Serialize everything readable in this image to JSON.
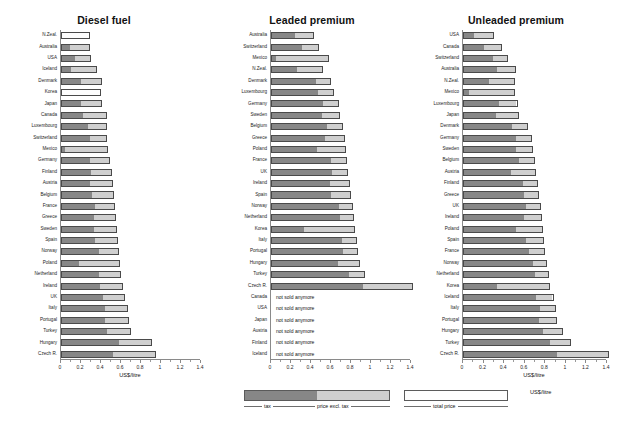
{
  "figure": {
    "unit_label": "US$/litre",
    "colors": {
      "tax": "#878787",
      "net": "#cfcfcf",
      "total": "#cfcfcf",
      "axis": "#8a8a8a"
    },
    "not_sold_text": "not sold anymore"
  },
  "legend_left": {
    "tax_label": "tax",
    "net_label": "price excl. tax"
  },
  "legend_right": {
    "total_label": "total price"
  },
  "chart_data": [
    {
      "type": "bar",
      "orientation": "horizontal",
      "stacked": true,
      "title": "Diesel fuel",
      "xlabel": "US$/litre",
      "ylabel": "",
      "xlim": [
        0,
        1.4
      ],
      "xticks": [
        0,
        0.2,
        0.4,
        0.6,
        0.8,
        1,
        1.2,
        1.4
      ],
      "xticklabels": [
        "0",
        "0.2",
        "0.4",
        "0.6",
        "0.8",
        "1",
        "1.2",
        "1.4"
      ],
      "grid": false,
      "legend_position": "bottom-center",
      "series": [
        {
          "name": "tax",
          "color": "#878787"
        },
        {
          "name": "price excl. tax",
          "color": "#cfcfcf"
        }
      ],
      "categories": [
        "N.Zeal.",
        "Australia",
        "USA",
        "Iceland",
        "Denmark",
        "Korea",
        "Japan",
        "Canada",
        "Luxembourg",
        "Switzerland",
        "Mexico",
        "Germany",
        "Finland",
        "Austria",
        "Belgium",
        "France",
        "Greece",
        "Sweden",
        "Spain",
        "Norway",
        "Poland",
        "Netherland",
        "Ireland",
        "UK",
        "Italy",
        "Portugal",
        "Turkey",
        "Hungary",
        "Czech R."
      ],
      "tax": [
        0.0,
        0.09,
        0.14,
        0.1,
        0.2,
        0.0,
        0.2,
        0.22,
        0.27,
        0.29,
        0.03,
        0.29,
        0.3,
        0.29,
        0.31,
        0.34,
        0.33,
        0.33,
        0.34,
        0.38,
        0.18,
        0.38,
        0.39,
        0.42,
        0.44,
        0.44,
        0.46,
        0.58,
        0.52
      ],
      "net": [
        0.29,
        0.2,
        0.16,
        0.26,
        0.21,
        0.4,
        0.21,
        0.24,
        0.19,
        0.17,
        0.44,
        0.2,
        0.21,
        0.23,
        0.22,
        0.2,
        0.22,
        0.23,
        0.23,
        0.2,
        0.41,
        0.22,
        0.23,
        0.22,
        0.23,
        0.24,
        0.24,
        0.33,
        0.43
      ],
      "totals": [
        0.29,
        0.29,
        0.3,
        0.36,
        0.41,
        0.4,
        0.41,
        0.46,
        0.46,
        0.46,
        0.47,
        0.49,
        0.51,
        0.52,
        0.53,
        0.54,
        0.55,
        0.56,
        0.57,
        0.58,
        0.59,
        0.6,
        0.62,
        0.64,
        0.67,
        0.68,
        0.7,
        0.91,
        0.95
      ]
    },
    {
      "type": "bar",
      "orientation": "horizontal",
      "stacked": true,
      "title": "Leaded premium",
      "xlabel": "",
      "ylabel": "",
      "xlim": [
        0,
        1.4
      ],
      "xticks": [
        0,
        0.2,
        0.4,
        0.6,
        0.8,
        1,
        1.2,
        1.4
      ],
      "xticklabels": [
        "0",
        "0.2",
        "0.4",
        "0.6",
        "0.8",
        "1",
        "1.2",
        "1.4"
      ],
      "grid": false,
      "legend_position": "bottom-center",
      "series": [
        {
          "name": "tax",
          "color": "#878787"
        },
        {
          "name": "price excl. tax",
          "color": "#cfcfcf"
        }
      ],
      "categories": [
        "Australia",
        "Switzerland",
        "Mexico",
        "N.Zeal.",
        "Denmark",
        "Luxembourg",
        "Germany",
        "Sweden",
        "Belgium",
        "Greece",
        "Poland",
        "France",
        "UK",
        "Ireland",
        "Spain",
        "Norway",
        "Netherland",
        "Korea",
        "Italy",
        "Portugal",
        "Hungary",
        "Turkey",
        "Czech R.",
        "Canada",
        "USA",
        "Japan",
        "Austria",
        "Finland",
        "Iceland"
      ],
      "tax": [
        0.24,
        0.31,
        0.04,
        0.26,
        0.45,
        0.48,
        0.53,
        0.52,
        0.57,
        0.54,
        0.46,
        0.61,
        0.62,
        0.6,
        0.6,
        0.69,
        0.7,
        0.33,
        0.72,
        0.73,
        0.68,
        0.79,
        0.92,
        null,
        null,
        null,
        null,
        null,
        null
      ],
      "net": [
        0.19,
        0.17,
        0.54,
        0.26,
        0.15,
        0.15,
        0.15,
        0.17,
        0.15,
        0.2,
        0.29,
        0.15,
        0.15,
        0.19,
        0.2,
        0.13,
        0.13,
        0.51,
        0.14,
        0.14,
        0.21,
        0.15,
        0.5,
        null,
        null,
        null,
        null,
        null,
        null
      ],
      "totals": [
        0.43,
        0.48,
        0.58,
        0.52,
        0.6,
        0.63,
        0.68,
        0.69,
        0.72,
        0.74,
        0.75,
        0.76,
        0.77,
        0.79,
        0.8,
        0.82,
        0.83,
        0.84,
        0.86,
        0.87,
        0.89,
        0.94,
        1.42,
        null,
        null,
        null,
        null,
        null,
        null
      ],
      "not_sold": [
        "Canada",
        "USA",
        "Japan",
        "Austria",
        "Finland",
        "Iceland"
      ]
    },
    {
      "type": "bar",
      "orientation": "horizontal",
      "stacked": true,
      "title": "Unleaded premium",
      "xlabel": "US$/litre",
      "ylabel": "",
      "xlim": [
        0,
        1.4
      ],
      "xticks": [
        0,
        0.2,
        0.4,
        0.6,
        0.8,
        1,
        1.2,
        1.4
      ],
      "xticklabels": [
        "0",
        "0.2",
        "0.4",
        "0.6",
        "0.8",
        "1",
        "1.2",
        "1.4"
      ],
      "grid": false,
      "legend_position": "bottom-right",
      "series": [
        {
          "name": "total price",
          "color": "#cfcfcf"
        }
      ],
      "categories": [
        "USA",
        "Canada",
        "Switzerland",
        "Australia",
        "N.Zeal.",
        "Mexico",
        "Luxembourg",
        "Japan",
        "Denmark",
        "Germany",
        "Sweden",
        "Belgium",
        "Austria",
        "Finland",
        "Greece",
        "UK",
        "Ireland",
        "Poland",
        "Spain",
        "France",
        "Norway",
        "Netherland",
        "Korea",
        "Iceland",
        "Italy",
        "Portugal",
        "Hungary",
        "Turkey",
        "Czech R."
      ],
      "tax": [
        0.1,
        0.21,
        0.29,
        0.33,
        0.25,
        0.05,
        0.35,
        0.32,
        0.48,
        0.52,
        0.52,
        0.55,
        0.47,
        0.59,
        0.6,
        0.62,
        0.6,
        0.52,
        0.62,
        0.65,
        0.69,
        0.71,
        0.33,
        0.72,
        0.76,
        0.75,
        0.78,
        0.85,
        0.92
      ],
      "net": [
        0.2,
        0.17,
        0.15,
        0.19,
        0.26,
        0.46,
        0.18,
        0.22,
        0.15,
        0.15,
        0.16,
        0.15,
        0.24,
        0.14,
        0.14,
        0.14,
        0.17,
        0.26,
        0.17,
        0.15,
        0.13,
        0.13,
        0.52,
        0.16,
        0.14,
        0.16,
        0.19,
        0.2,
        0.5
      ],
      "totals": [
        0.3,
        0.38,
        0.44,
        0.52,
        0.51,
        0.51,
        0.53,
        0.54,
        0.63,
        0.67,
        0.68,
        0.7,
        0.71,
        0.73,
        0.74,
        0.76,
        0.77,
        0.78,
        0.79,
        0.8,
        0.82,
        0.84,
        0.85,
        0.88,
        0.9,
        0.91,
        0.97,
        1.05,
        1.42
      ]
    }
  ]
}
